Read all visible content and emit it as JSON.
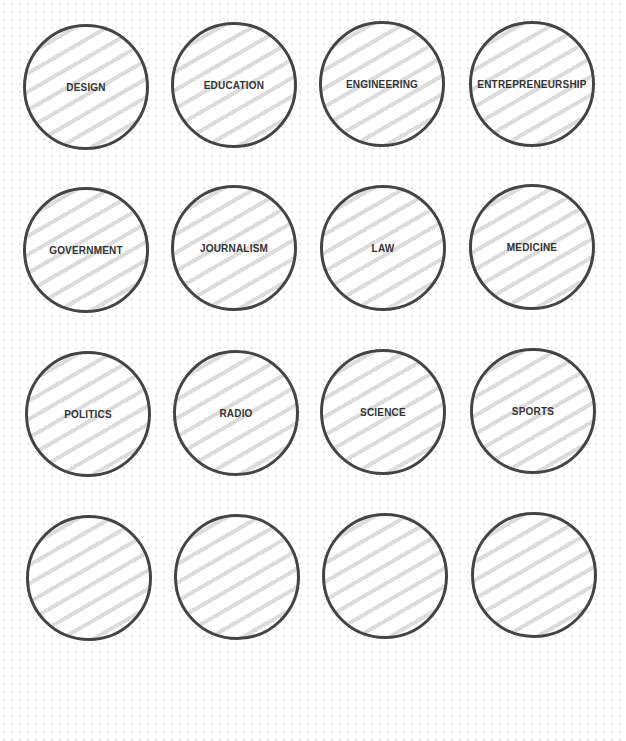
{
  "bubbles": [
    {
      "label": "DESIGN"
    },
    {
      "label": "EDUCATION"
    },
    {
      "label": "ENGINEERING"
    },
    {
      "label": "ENTREPRENEURSHIP"
    },
    {
      "label": "GOVERNMENT"
    },
    {
      "label": "JOURNALISM"
    },
    {
      "label": "LAW"
    },
    {
      "label": "MEDICINE"
    },
    {
      "label": "POLITICS"
    },
    {
      "label": "RADIO"
    },
    {
      "label": "SCIENCE"
    },
    {
      "label": "SPORTS"
    },
    {
      "label": ""
    },
    {
      "label": ""
    },
    {
      "label": ""
    },
    {
      "label": ""
    }
  ],
  "colors": {
    "border": "#444444",
    "hatch": "#dcdcdc",
    "text": "#333333"
  }
}
